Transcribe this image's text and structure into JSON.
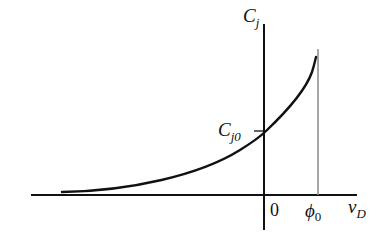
{
  "diagram": {
    "type": "junction-capacitance-vs-voltage",
    "axes": {
      "y_label": "C",
      "y_label_sub": "j",
      "x_label": "v",
      "x_label_sub": "D"
    },
    "annotations": {
      "intercept_label": "C",
      "intercept_label_sub": "j0",
      "origin_label": "0",
      "phi_label": "ϕ",
      "phi_label_sub": "0"
    },
    "colors": {
      "curve": "#111111",
      "axis": "#111111",
      "asymptote": "#8a8a8a"
    }
  }
}
